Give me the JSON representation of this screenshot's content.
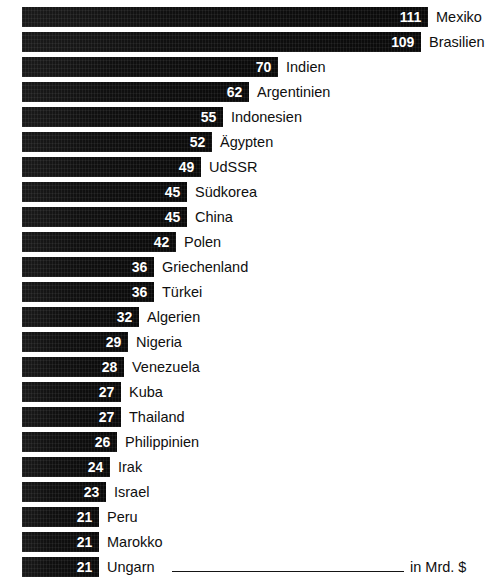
{
  "chart_data": {
    "type": "bar",
    "orientation": "horizontal",
    "title": "",
    "subtitle": "",
    "xlabel": "in Mrd. $",
    "ylabel": "",
    "unit_label": "in Mrd. $",
    "grid": false,
    "legend": null,
    "xlim": [
      0,
      111
    ],
    "value_suffix": "",
    "categories": [
      "Mexiko",
      "Brasilien",
      "Indien",
      "Argentinien",
      "Indonesien",
      "Ägypten",
      "UdSSR",
      "Südkorea",
      "China",
      "Polen",
      "Griechenland",
      "Türkei",
      "Algerien",
      "Nigeria",
      "Venezuela",
      "Kuba",
      "Thailand",
      "Philippinien",
      "Irak",
      "Israel",
      "Peru",
      "Marokko",
      "Ungarn"
    ],
    "values": [
      111,
      109,
      70,
      62,
      55,
      52,
      49,
      45,
      45,
      42,
      36,
      36,
      32,
      29,
      28,
      27,
      27,
      26,
      24,
      23,
      21,
      21,
      21
    ],
    "bars": [
      {
        "label": "Mexiko",
        "value": 111,
        "value_text": "111"
      },
      {
        "label": "Brasilien",
        "value": 109,
        "value_text": "109"
      },
      {
        "label": "Indien",
        "value": 70,
        "value_text": "70"
      },
      {
        "label": "Argentinien",
        "value": 62,
        "value_text": "62"
      },
      {
        "label": "Indonesien",
        "value": 55,
        "value_text": "55"
      },
      {
        "label": "Ägypten",
        "value": 52,
        "value_text": "52"
      },
      {
        "label": "UdSSR",
        "value": 49,
        "value_text": "49"
      },
      {
        "label": "Südkorea",
        "value": 45,
        "value_text": "45"
      },
      {
        "label": "China",
        "value": 45,
        "value_text": "45"
      },
      {
        "label": "Polen",
        "value": 42,
        "value_text": "42"
      },
      {
        "label": "Griechenland",
        "value": 36,
        "value_text": "36"
      },
      {
        "label": "Türkei",
        "value": 36,
        "value_text": "36"
      },
      {
        "label": "Algerien",
        "value": 32,
        "value_text": "32"
      },
      {
        "label": "Nigeria",
        "value": 29,
        "value_text": "29"
      },
      {
        "label": "Venezuela",
        "value": 28,
        "value_text": "28"
      },
      {
        "label": "Kuba",
        "value": 27,
        "value_text": "27"
      },
      {
        "label": "Thailand",
        "value": 27,
        "value_text": "27"
      },
      {
        "label": "Philippinien",
        "value": 26,
        "value_text": "26"
      },
      {
        "label": "Irak",
        "value": 24,
        "value_text": "24"
      },
      {
        "label": "Israel",
        "value": 23,
        "value_text": "23"
      },
      {
        "label": "Peru",
        "value": 21,
        "value_text": "21"
      },
      {
        "label": "Marokko",
        "value": 21,
        "value_text": "21"
      },
      {
        "label": "Ungarn",
        "value": 21,
        "value_text": "21"
      }
    ],
    "colors": {
      "bar": "#0d0d0d",
      "value_text": "#ffffff",
      "label_text": "#0f0f0f",
      "background": "#ffffff"
    }
  }
}
